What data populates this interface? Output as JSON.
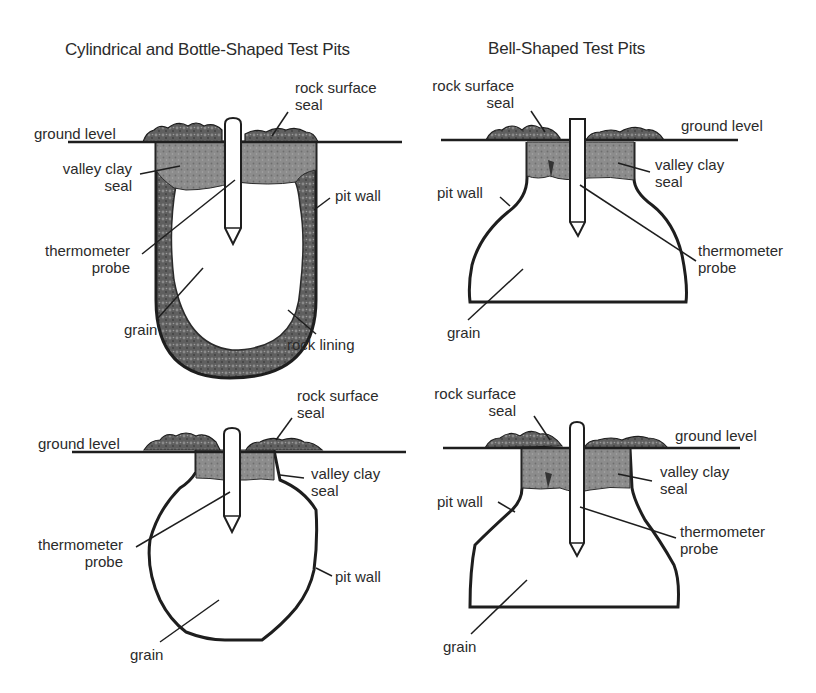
{
  "headings": {
    "left": "Cylindrical and Bottle-Shaped Test Pits",
    "right": "Bell-Shaped Test Pits"
  },
  "panels": {
    "cylindrical": {
      "rock_surface_seal": [
        "rock surface",
        "seal"
      ],
      "ground_level": "ground level",
      "valley_clay_seal": [
        "valley clay",
        "seal"
      ],
      "pit_wall": "pit wall",
      "thermometer_probe": [
        "thermometer",
        "probe"
      ],
      "grain": "grain",
      "rock_lining": "rock lining"
    },
    "bell_top": {
      "rock_surface_seal": [
        "rock surface",
        "seal"
      ],
      "ground_level": "ground level",
      "valley_clay_seal": [
        "valley clay",
        "seal"
      ],
      "pit_wall": "pit wall",
      "thermometer_probe": [
        "thermometer",
        "probe"
      ],
      "grain": "grain"
    },
    "bottle": {
      "rock_surface_seal": [
        "rock surface",
        "seal"
      ],
      "ground_level": "ground level",
      "valley_clay_seal": [
        "valley clay",
        "seal"
      ],
      "thermometer_probe": [
        "thermometer",
        "probe"
      ],
      "pit_wall": "pit wall",
      "grain": "grain"
    },
    "bell_bottom": {
      "rock_surface_seal": [
        "rock surface",
        "seal"
      ],
      "ground_level": "ground level",
      "valley_clay_seal": [
        "valley clay",
        "seal"
      ],
      "pit_wall": "pit wall",
      "thermometer_probe": [
        "thermometer",
        "probe"
      ],
      "grain": "grain"
    }
  },
  "colors": {
    "line": "#1e1e1e",
    "clay": "#8a8a8a",
    "rock": "#6a6a6a",
    "lining": "#5e5e5e"
  }
}
